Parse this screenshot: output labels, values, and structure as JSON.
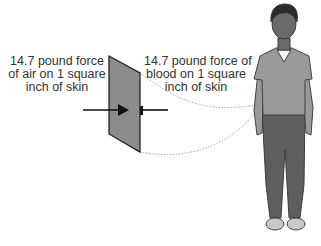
{
  "diagram": {
    "labels": {
      "air": [
        "14.7 pound force",
        "of air on 1 square",
        "inch of skin"
      ],
      "blood": [
        "14.7 pound force of",
        "blood on 1 square",
        "inch of skin"
      ]
    },
    "elements": {
      "skin_patch": "gray panel representing 1 square inch of skin",
      "arrow_air": "arrow pointing right toward skin",
      "arrow_blood": "arrow pointing left toward skin",
      "person": "standing man illustration",
      "callout_lines": "dotted lines connecting skin patch to forearm"
    },
    "colors": {
      "panel": "#8c8c8c",
      "shirt": "#9a9a9a",
      "pants": "#5e5e5e",
      "text": "#333333"
    }
  }
}
